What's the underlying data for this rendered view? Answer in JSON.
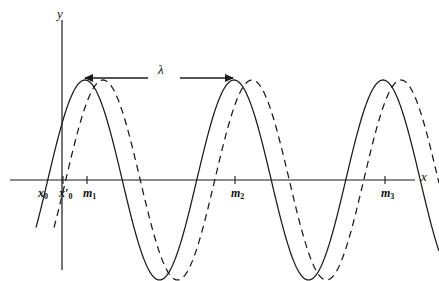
{
  "figure": {
    "type": "wave-diagram",
    "background_color": "#ffffff",
    "stroke_color": "#1a1a1a"
  },
  "axes": {
    "y_label": "y",
    "x_label": "x",
    "x_axis_y_px": 180,
    "y_axis_x_px": 62,
    "x_axis_start_px": 10,
    "x_axis_end_px": 415,
    "y_axis_top_px": 20,
    "y_axis_bottom_px": 270
  },
  "annotation": {
    "lambda_symbol": "λ",
    "arrow_y_px": 78,
    "arrow_left_x_px": 85,
    "arrow_right_x_px": 233,
    "label_x_px": 158,
    "label_y_px": 62,
    "description": "wavelength"
  },
  "tick_labels": [
    {
      "id": "x0",
      "text": "x",
      "sub": "0",
      "prime": false,
      "x_px": 38,
      "tick": false
    },
    {
      "id": "x0prime",
      "text": "x",
      "sub": "0",
      "prime": true,
      "x_px": 59,
      "tick": true
    },
    {
      "id": "m1",
      "text": "m",
      "sub": "1",
      "prime": false,
      "x_px": 83,
      "tick": true
    },
    {
      "id": "m2",
      "text": "m",
      "sub": "2",
      "prime": false,
      "x_px": 231,
      "tick": true
    },
    {
      "id": "m3",
      "text": "m",
      "sub": "3",
      "prime": false,
      "x_px": 381,
      "tick": true
    }
  ],
  "chart_data": {
    "type": "line",
    "title": "",
    "xlabel": "x",
    "ylabel": "y",
    "grid": false,
    "legend": "none",
    "axis_origin_px": {
      "x": 62,
      "y": 180
    },
    "amplitude_px": 100,
    "wavelength_px": 149,
    "series": [
      {
        "name": "solid-wave",
        "style": "solid",
        "phase_peak_px": [
          85,
          234,
          383
        ],
        "x_start_px": 36,
        "x_end_px": 439,
        "zero_crossings_px": [
          36,
          122,
          160,
          271,
          309,
          420
        ],
        "troughs_px": [
          159,
          308
        ],
        "color": "#1a1a1a"
      },
      {
        "name": "dashed-wave",
        "style": "dashed",
        "phase_peak_px": [
          103,
          252,
          401
        ],
        "x_start_px": 54,
        "x_end_px": 439,
        "zero_crossings_px": [
          54,
          140,
          178,
          289,
          327,
          438
        ],
        "troughs_px": [
          177,
          326
        ],
        "color": "#1a1a1a"
      }
    ],
    "annotations": [
      {
        "text": "λ",
        "x_px": 158,
        "y_px": 68,
        "type": "span-arrow",
        "from_px": 85,
        "to_px": 233
      }
    ]
  }
}
